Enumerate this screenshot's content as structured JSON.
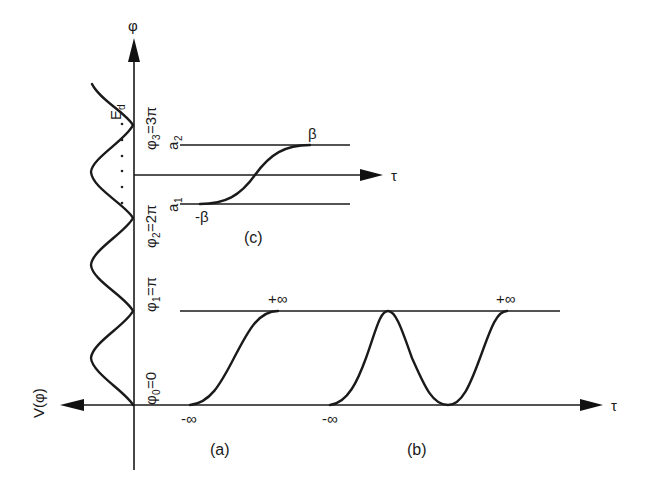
{
  "figure": {
    "axes": {
      "vertical_label": "φ",
      "potential_label": "V(φ)",
      "horizontal_label": "τ"
    },
    "potential_levels": [
      {
        "sym": "φ",
        "sub": "0",
        "value": "=0"
      },
      {
        "sym": "φ",
        "sub": "1",
        "value": "=π"
      },
      {
        "sym": "φ",
        "sub": "2",
        "value": "=2π"
      },
      {
        "sym": "φ",
        "sub": "3",
        "value": "=3π"
      }
    ],
    "energy_label": {
      "main": "E",
      "sub": "d"
    },
    "panel_a": {
      "caption": "(a)",
      "start_label": "-∞",
      "end_label": "+∞"
    },
    "panel_b": {
      "caption": "(b)",
      "start_label": "-∞",
      "end_label": "+∞"
    },
    "panel_c": {
      "caption": "(c)",
      "upper_line": {
        "main": "a",
        "sub": "2"
      },
      "lower_line": {
        "main": "a",
        "sub": "1"
      },
      "start_label": "-β",
      "end_label": "β",
      "axis_label": "τ"
    },
    "colors": {
      "ink": "#1a1a1a",
      "background": "#ffffff"
    }
  }
}
